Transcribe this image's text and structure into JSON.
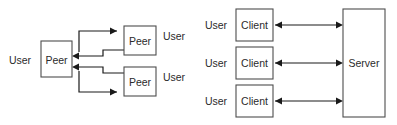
{
  "figure": {
    "background_color": "#ffffff",
    "box_stroke_color": "#4d4d4d",
    "line_color": "#1a1a1a",
    "text_color": "#2b2b2b"
  },
  "diagrams": [
    {
      "id": "peer-to-peer",
      "name": "Peer to peer topology",
      "nodes": [
        {
          "id": "peer-left",
          "label": "Peer",
          "x": 41,
          "y": 41,
          "w": 31,
          "h": 36
        },
        {
          "id": "peer-top",
          "label": "Peer",
          "x": 124,
          "y": 26,
          "w": 32,
          "h": 29
        },
        {
          "id": "peer-bottom",
          "label": "Peer",
          "x": 124,
          "y": 67,
          "w": 32,
          "h": 29
        }
      ],
      "user_labels": [
        {
          "id": "user-left",
          "label": "User",
          "x": 20,
          "y": 59
        },
        {
          "id": "user-top",
          "label": "User",
          "x": 174,
          "y": 36
        },
        {
          "id": "user-bottom",
          "label": "User",
          "x": 174,
          "y": 77
        }
      ],
      "connections": [
        {
          "id": "peer-left-to-peer-top",
          "from": "peer-left",
          "to": "peer-top",
          "direction": "one-way"
        },
        {
          "id": "peer-top-to-peer-left",
          "from": "peer-top",
          "to": "peer-left",
          "direction": "one-way"
        },
        {
          "id": "peer-left-to-peer-bottom",
          "from": "peer-left",
          "to": "peer-bottom",
          "direction": "one-way"
        },
        {
          "id": "peer-bottom-to-peer-left",
          "from": "peer-bottom",
          "to": "peer-left",
          "direction": "one-way"
        }
      ]
    },
    {
      "id": "client-server",
      "name": "Client server topology",
      "nodes": [
        {
          "id": "client-1",
          "label": "Client",
          "x": 236,
          "y": 9,
          "w": 37,
          "h": 32
        },
        {
          "id": "client-2",
          "label": "Client",
          "x": 236,
          "y": 47,
          "w": 37,
          "h": 32
        },
        {
          "id": "client-3",
          "label": "Client",
          "x": 236,
          "y": 85,
          "w": 37,
          "h": 32
        },
        {
          "id": "server",
          "label": "Server",
          "x": 343,
          "y": 9,
          "w": 42,
          "h": 108
        }
      ],
      "user_labels": [
        {
          "id": "user-client-1",
          "label": "User",
          "x": 216,
          "y": 25
        },
        {
          "id": "user-client-2",
          "label": "User",
          "x": 216,
          "y": 63
        },
        {
          "id": "user-client-3",
          "label": "User",
          "x": 216,
          "y": 101
        }
      ],
      "connections": [
        {
          "id": "client-1-server",
          "from": "client-1",
          "to": "server",
          "direction": "bidirectional"
        },
        {
          "id": "client-2-server",
          "from": "client-2",
          "to": "server",
          "direction": "bidirectional"
        },
        {
          "id": "client-3-server",
          "from": "client-3",
          "to": "server",
          "direction": "bidirectional"
        }
      ]
    }
  ]
}
